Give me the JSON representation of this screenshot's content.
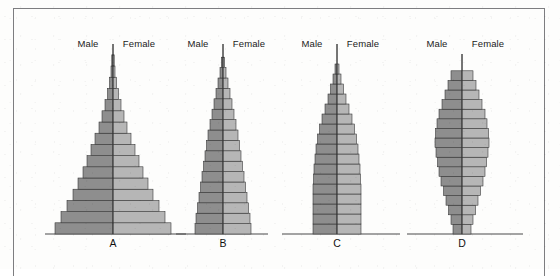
{
  "figure": {
    "background_color": "#fdfdfc",
    "frame_color": "#7d7d80",
    "male_color": "#8e8e8e",
    "female_color": "#b6b6b6",
    "bar_outline_color": "#2e2e2e",
    "baseline_color": "#4a4a4a",
    "axis_color": "#3a3a3a",
    "label_male": "Male",
    "label_female": "Female"
  },
  "chart_data": {
    "type": "bar",
    "chart_variant": "population-pyramid-set",
    "title": "",
    "subtitle": "",
    "xlabel": "",
    "ylabel": "",
    "grid": false,
    "legend_position": "top-inline",
    "legend": [
      "Male",
      "Female"
    ],
    "panels": [
      {
        "label": "A",
        "shape": "expansive",
        "center_x": 113,
        "baseline_y": 234,
        "label_y": 47,
        "letter_y": 247,
        "bar_height": 11.2,
        "bar_count": 16,
        "axis_top_y": 44,
        "male_widths": [
          58,
          52,
          46,
          40,
          35,
          30,
          26,
          22,
          18,
          14,
          11,
          8,
          5.5,
          3.5,
          2,
          1.2
        ],
        "female_widths": [
          58,
          52,
          46,
          40,
          35,
          30,
          26,
          22,
          18,
          14,
          11,
          8,
          5.5,
          3.5,
          2,
          1.2
        ]
      },
      {
        "label": "B",
        "shape": "expansive-narrow",
        "center_x": 223,
        "baseline_y": 234,
        "label_y": 47,
        "letter_y": 247,
        "bar_height": 10.4,
        "bar_count": 17,
        "axis_top_y": 44,
        "male_widths": [
          28,
          27,
          25.5,
          24,
          22.5,
          21,
          19.5,
          18,
          16.5,
          15,
          13,
          11,
          9,
          7,
          5,
          3,
          1.6
        ],
        "female_widths": [
          28,
          27,
          25.5,
          24,
          22.5,
          21,
          19.5,
          18,
          16.5,
          15,
          13,
          11,
          9,
          7,
          5,
          3,
          1.6
        ]
      },
      {
        "label": "C",
        "shape": "stationary",
        "center_x": 337,
        "baseline_y": 234,
        "label_y": 47,
        "letter_y": 247,
        "bar_height": 10.0,
        "bar_count": 17,
        "axis_top_y": 44,
        "male_widths": [
          24,
          24,
          24,
          24,
          24,
          23.5,
          23,
          22,
          21,
          19.5,
          17.5,
          15,
          12,
          9,
          6.5,
          4,
          2
        ],
        "female_widths": [
          24,
          24,
          24,
          24,
          24,
          23.5,
          23,
          22,
          21,
          19.5,
          17.5,
          15,
          12,
          9,
          6.5,
          4,
          2
        ]
      },
      {
        "label": "D",
        "shape": "constrictive",
        "center_x": 462,
        "baseline_y": 234,
        "label_y": 47,
        "letter_y": 247,
        "bar_height": 9.6,
        "bar_count": 17,
        "axis_top_y": 54,
        "male_widths": [
          9,
          11,
          13.5,
          16,
          18.5,
          21,
          23,
          24.5,
          26,
          27,
          26.5,
          25,
          23,
          20,
          17,
          14,
          11
        ],
        "female_widths": [
          9,
          11,
          13.5,
          16,
          18.5,
          21,
          23,
          24.5,
          26,
          27,
          26.5,
          25,
          23,
          20,
          17,
          14,
          11
        ]
      }
    ],
    "baselines": [
      {
        "x1": 45,
        "x2": 186,
        "y": 234
      },
      {
        "x1": 176,
        "x2": 268,
        "y": 234
      },
      {
        "x1": 282,
        "x2": 400,
        "y": 234
      },
      {
        "x1": 407,
        "x2": 523,
        "y": 234
      }
    ],
    "sex_label_offsets": {
      "male_dx": -25,
      "female_dx": 26
    }
  }
}
